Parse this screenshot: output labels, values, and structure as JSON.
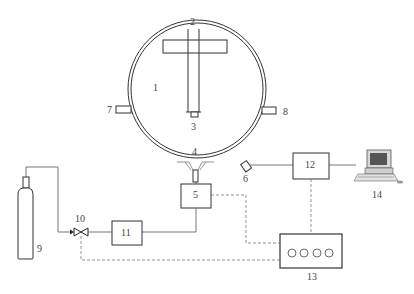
{
  "diagram": {
    "type": "experimental apparatus schematic",
    "colors": {
      "line": "#333333",
      "dashed": "#777777",
      "label": "#444444",
      "background": "#ffffff"
    },
    "components": [
      {
        "id": "1",
        "label": "1",
        "name": "spherical-chamber"
      },
      {
        "id": "2",
        "label": "2",
        "name": "probe-tube"
      },
      {
        "id": "3",
        "label": "3",
        "name": "probe-tip"
      },
      {
        "id": "4",
        "label": "4",
        "name": "spray-nozzle"
      },
      {
        "id": "5",
        "label": "5",
        "name": "injector-unit"
      },
      {
        "id": "6",
        "label": "6",
        "name": "pressure-sensor-port"
      },
      {
        "id": "7",
        "label": "7",
        "name": "left-port"
      },
      {
        "id": "8",
        "label": "8",
        "name": "right-port"
      },
      {
        "id": "9",
        "label": "9",
        "name": "gas-cylinder"
      },
      {
        "id": "10",
        "label": "10",
        "name": "valve"
      },
      {
        "id": "11",
        "label": "11",
        "name": "flow-unit"
      },
      {
        "id": "12",
        "label": "12",
        "name": "data-acquisition-box"
      },
      {
        "id": "13",
        "label": "13",
        "name": "controller"
      },
      {
        "id": "14",
        "label": "14",
        "name": "computer"
      }
    ],
    "controller_indicators": 4
  }
}
